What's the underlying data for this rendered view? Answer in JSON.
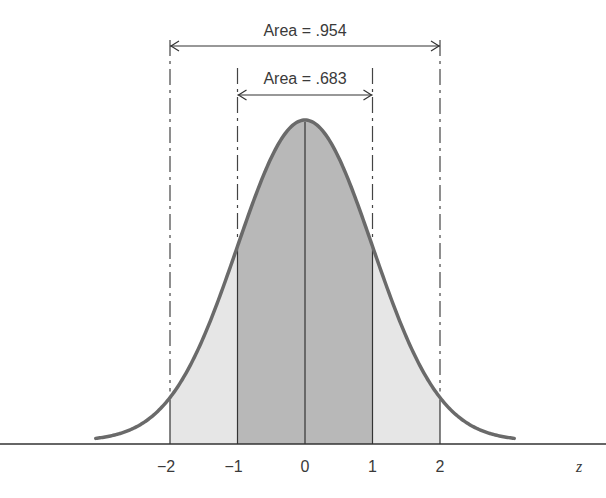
{
  "chart_data": {
    "type": "area",
    "title": "",
    "xlabel": "z",
    "ylabel": "",
    "xlim": [
      -3.1,
      3.1
    ],
    "x_ticks": [
      -2,
      -1,
      0,
      1,
      2
    ],
    "x_tick_labels": [
      "−2",
      "−1",
      "0",
      "1",
      "2"
    ],
    "curve": {
      "name": "standard normal density",
      "mean": 0,
      "sd": 1
    },
    "shaded_regions": [
      {
        "name": "within 1 sd",
        "from": -1,
        "to": 1,
        "area": 0.683,
        "label": "Area = .683",
        "color": "#b8b8b8"
      },
      {
        "name": "within 2 sd",
        "from": -2,
        "to": 2,
        "area": 0.954,
        "label": "Area = .954",
        "color": "#e6e6e6"
      }
    ],
    "vertical_lines": [
      -2,
      -1,
      0,
      1,
      2
    ],
    "colors": {
      "curve": "#6a6a6a",
      "inner_fill": "#b8b8b8",
      "outer_fill": "#e6e6e6",
      "lines": "#333333"
    }
  }
}
